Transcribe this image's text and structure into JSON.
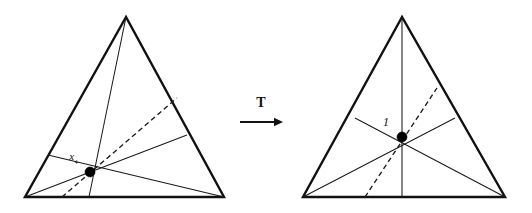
{
  "figure": {
    "background_color": "#ffffff",
    "line_color": "#111111",
    "dot_color": "#000000",
    "width": 532,
    "height": 213
  },
  "map": {
    "operator_label": "T",
    "arrow_direction": "right",
    "arrow_x1": 240,
    "arrow_x2": 283,
    "arrow_y": 122,
    "label_x": 261,
    "label_y": 107
  },
  "left_panel": {
    "name": "source-triangle",
    "vertices": {
      "apex": {
        "x": 126,
        "y": 17
      },
      "bottom_left": {
        "x": 25,
        "y": 197
      },
      "bottom_right": {
        "x": 224,
        "y": 197
      }
    },
    "concurrency_point": {
      "x": 90,
      "y": 172,
      "radius": 5.0
    },
    "point_label": {
      "base": "x",
      "subscript": "+",
      "full": "x+",
      "x": 74,
      "y": 160
    },
    "cevians": [
      {
        "name": "cevian-from-apex",
        "from": "apex",
        "to_x": 89,
        "to_y": 197,
        "style": "solid"
      },
      {
        "name": "cevian-from-bottom-left",
        "from": "bottom_left",
        "to_x": 187,
        "to_y": 135,
        "style": "solid"
      },
      {
        "name": "cevian-from-bottom-right",
        "from": "bottom_right",
        "to_x": 48,
        "to_y": 155,
        "style": "solid"
      },
      {
        "name": "cevian-dashed",
        "from": "base_point",
        "from_x": 62,
        "from_y": 197,
        "to_x": 177,
        "to_y": 98,
        "style": "dashed"
      }
    ]
  },
  "right_panel": {
    "name": "image-triangle",
    "vertices": {
      "apex": {
        "x": 402,
        "y": 17
      },
      "bottom_left": {
        "x": 303,
        "y": 197
      },
      "bottom_right": {
        "x": 505,
        "y": 197
      }
    },
    "concurrency_point": {
      "x": 402,
      "y": 137,
      "radius": 5.0
    },
    "point_label": {
      "base": "1",
      "subscript": "",
      "full": "1",
      "x": 386,
      "y": 126
    },
    "cevians": [
      {
        "name": "cevian-from-apex",
        "from": "apex",
        "to_x": 402,
        "to_y": 197,
        "style": "solid"
      },
      {
        "name": "cevian-from-bottom-left",
        "from": "bottom_left",
        "to_x": 455,
        "to_y": 118,
        "style": "solid"
      },
      {
        "name": "cevian-from-bottom-right",
        "from": "bottom_right",
        "to_x": 355,
        "to_y": 118,
        "style": "solid"
      },
      {
        "name": "cevian-dashed",
        "from": "base_point",
        "from_x": 365,
        "from_y": 197,
        "to_x": 437,
        "to_y": 88,
        "style": "dashed"
      }
    ]
  }
}
